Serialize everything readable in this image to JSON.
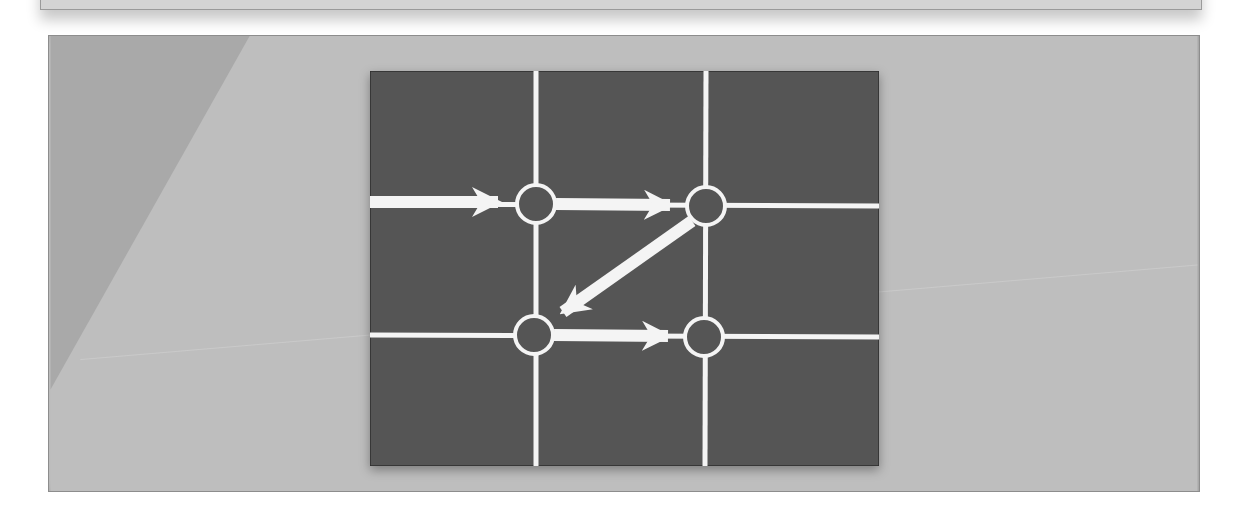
{
  "colors": {
    "page_background": "#ffffff",
    "panel_background": "#bdbdbd",
    "panel_dark_triangle": "#a9a9a9",
    "panel_border": "#8d8d8d",
    "diagram_background": "#555555",
    "diagram_border": "#2e2e2e",
    "line_color": "#f4f4f4"
  },
  "diagram": {
    "type": "grid-path",
    "grid": {
      "vertical_lines_x": [
        166,
        336
      ],
      "horizontal_lines_y": [
        133,
        265
      ]
    },
    "nodes": [
      {
        "id": "top-left",
        "x": 166,
        "y": 133,
        "r": 19
      },
      {
        "id": "top-right",
        "x": 336,
        "y": 135,
        "r": 19
      },
      {
        "id": "bottom-left",
        "x": 164,
        "y": 264,
        "r": 19
      },
      {
        "id": "bottom-right",
        "x": 334,
        "y": 266,
        "r": 19
      }
    ],
    "arrows": [
      {
        "from": "left-edge",
        "to": "top-left"
      },
      {
        "from": "top-left",
        "to": "top-right"
      },
      {
        "from": "top-right",
        "to": "bottom-left"
      },
      {
        "from": "bottom-left",
        "to": "bottom-right"
      }
    ]
  }
}
